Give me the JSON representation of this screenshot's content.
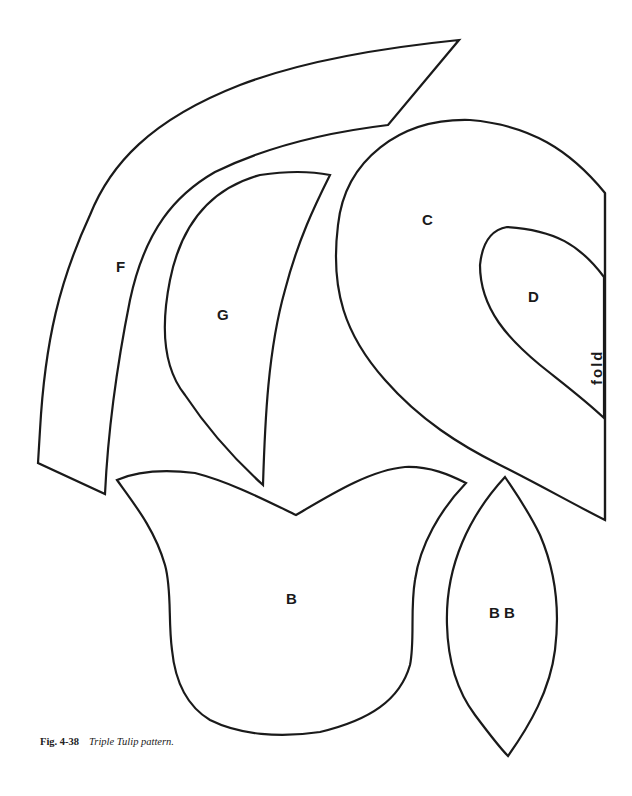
{
  "pattern": {
    "pieces": [
      {
        "id": "F",
        "label": "F"
      },
      {
        "id": "G",
        "label": "G"
      },
      {
        "id": "C",
        "label": "C"
      },
      {
        "id": "D",
        "label": "D"
      },
      {
        "id": "B",
        "label": "B"
      },
      {
        "id": "BB",
        "label": "B B"
      }
    ],
    "fold_label": "fold"
  },
  "caption": {
    "figure_number": "Fig. 4-38",
    "title": "Triple Tulip pattern."
  },
  "colors": {
    "outline": "#1a1a1a",
    "background": "#ffffff"
  }
}
